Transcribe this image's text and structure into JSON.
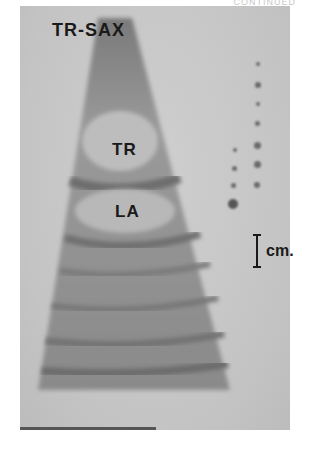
{
  "figure": {
    "header_fragment": "CONTINUED",
    "view_label": "TR-SAX",
    "structures": [
      {
        "id": "tr",
        "label": "TR"
      },
      {
        "id": "la",
        "label": "LA"
      }
    ],
    "scale": {
      "label": "cm."
    }
  }
}
